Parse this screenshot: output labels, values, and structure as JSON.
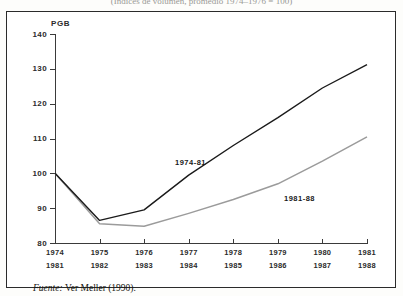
{
  "figure": {
    "title_fragment": "(Indices de volumen, promedio 1974–1976 = 100)",
    "source_prefix": "Fuente:",
    "source_text": "Ver Meller (1990)."
  },
  "chart_data": {
    "type": "line",
    "title": "",
    "xlabel": "",
    "ylabel": "PGB",
    "ylim": [
      80,
      140
    ],
    "yticks": [
      80,
      90,
      100,
      110,
      120,
      130,
      140
    ],
    "grid": false,
    "legend_position": "inline",
    "x_axis_rows": [
      [
        "1974",
        "1975",
        "1976",
        "1977",
        "1978",
        "1979",
        "1980",
        "1981"
      ],
      [
        "1981",
        "1982",
        "1983",
        "1984",
        "1985",
        "1986",
        "1987",
        "1988"
      ]
    ],
    "x_index": [
      0,
      1,
      2,
      3,
      4,
      5,
      6,
      7
    ],
    "series": [
      {
        "name": "1974-81",
        "color": "#1a1a1a",
        "label_position": {
          "x": 168,
          "y": 146
        },
        "values": [
          100.0,
          86.5,
          89.5,
          99.5,
          108.0,
          116.0,
          124.5,
          131.2
        ]
      },
      {
        "name": "1981-88",
        "color": "#9b9b9b",
        "label_position": {
          "x": 277,
          "y": 182
        },
        "values": [
          100.0,
          85.5,
          84.8,
          88.5,
          92.5,
          97.0,
          103.5,
          110.5
        ]
      }
    ]
  },
  "colors": {
    "frame": "#2b2b2b",
    "axis": "#3a3a3a",
    "series_primary": "#1a1a1a",
    "series_secondary": "#9b9b9b",
    "page_background": "#fdfdfb"
  }
}
